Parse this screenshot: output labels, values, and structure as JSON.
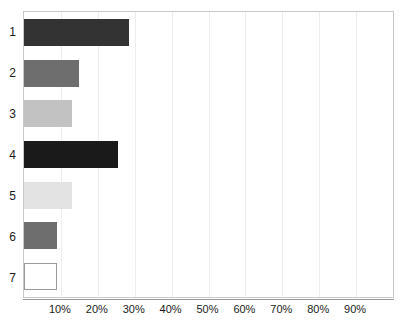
{
  "chart_data": {
    "type": "bar",
    "orientation": "horizontal",
    "title": "",
    "subtitle": "",
    "xlabel": "",
    "ylabel": "",
    "categories": [
      "1",
      "2",
      "3",
      "4",
      "5",
      "6",
      "7"
    ],
    "values": [
      28.5,
      14.8,
      12.9,
      25.5,
      12.9,
      9.0,
      9.0
    ],
    "value_suffix": "%",
    "xlim": [
      0,
      100
    ],
    "ylim": null,
    "xticks": [
      10,
      20,
      30,
      40,
      50,
      60,
      70,
      80,
      90
    ],
    "xtick_labels": [
      "10%",
      "20%",
      "30%",
      "40%",
      "50%",
      "60%",
      "70%",
      "80%",
      "90%"
    ],
    "ytick_labels": [
      "1",
      "2",
      "3",
      "4",
      "5",
      "6",
      "7"
    ],
    "grid": true,
    "grid_axis": "x",
    "grid_color": "#ededed",
    "legend": false,
    "legend_position": "none",
    "annotations": [],
    "bar_colors": [
      "#333333",
      "#6e6e6e",
      "#c2c2c2",
      "#1a1a1a",
      "#e3e3e3",
      "#6e6e6e",
      "#ffffff"
    ],
    "bar_border_colors": [
      "#333333",
      "#6e6e6e",
      "#c2c2c2",
      "#1a1a1a",
      "#e3e3e3",
      "#6e6e6e",
      "#9a9a9a"
    ],
    "plot_border_color": "#c8c8c8",
    "axis_color": "#9a9a9a",
    "text_color": "#1c1c1c",
    "background": "#ffffff"
  }
}
